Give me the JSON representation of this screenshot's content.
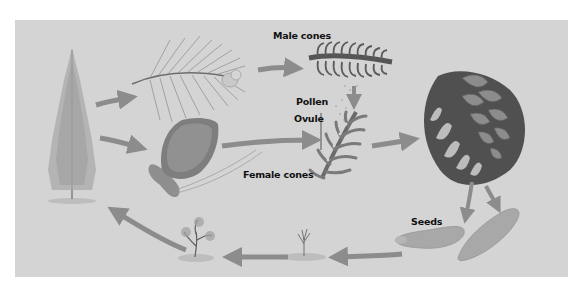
{
  "diagram": {
    "colors": {
      "background": "#d4d4d4",
      "arrow": "#8c8c8c",
      "dark_structure": "#555555",
      "mid_structure": "#7a7a7a",
      "light_structure": "#b8b8b8",
      "label_text": "#111111"
    },
    "labels": {
      "male_cones": "Male cones",
      "pollen": "Pollen",
      "ovule": "Ovule",
      "female_cones": "Female cones",
      "seeds": "Seeds"
    },
    "stages": [
      "mature-pine-tree",
      "pine-branch-with-male-cones",
      "female-pine-cone",
      "male-cone-section",
      "female-cone-section-with-ovules",
      "mature-open-cone",
      "winged-seeds",
      "seedling",
      "young-sapling"
    ]
  }
}
